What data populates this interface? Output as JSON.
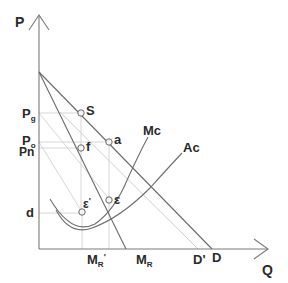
{
  "diagram": {
    "axes": {
      "y_label": "P",
      "x_label": "Q"
    },
    "price_labels": {
      "pg_main": "P",
      "pg_sub": "g",
      "po_main": "P",
      "po_sub": "o",
      "pn": "Pn",
      "d": "d"
    },
    "curve_labels": {
      "mc": "Mc",
      "ac": "Ac"
    },
    "point_labels": {
      "s": "S",
      "a": "a",
      "f": "f",
      "epsilon": "ε",
      "epsilon_prime_main": "ε",
      "epsilon_prime_mark": "'"
    },
    "quantity_labels": {
      "mr_prime_main": "M",
      "mr_prime_sub": "R",
      "mr_prime_mark": "'",
      "mr_main": "M",
      "mr_sub": "R",
      "d_prime": "D'",
      "d": "D"
    },
    "colors": {
      "axis": "#7a7a7a",
      "curve": "#6e6e6e",
      "guide": "#d4d4d4",
      "text": "#2a2a2a"
    }
  }
}
